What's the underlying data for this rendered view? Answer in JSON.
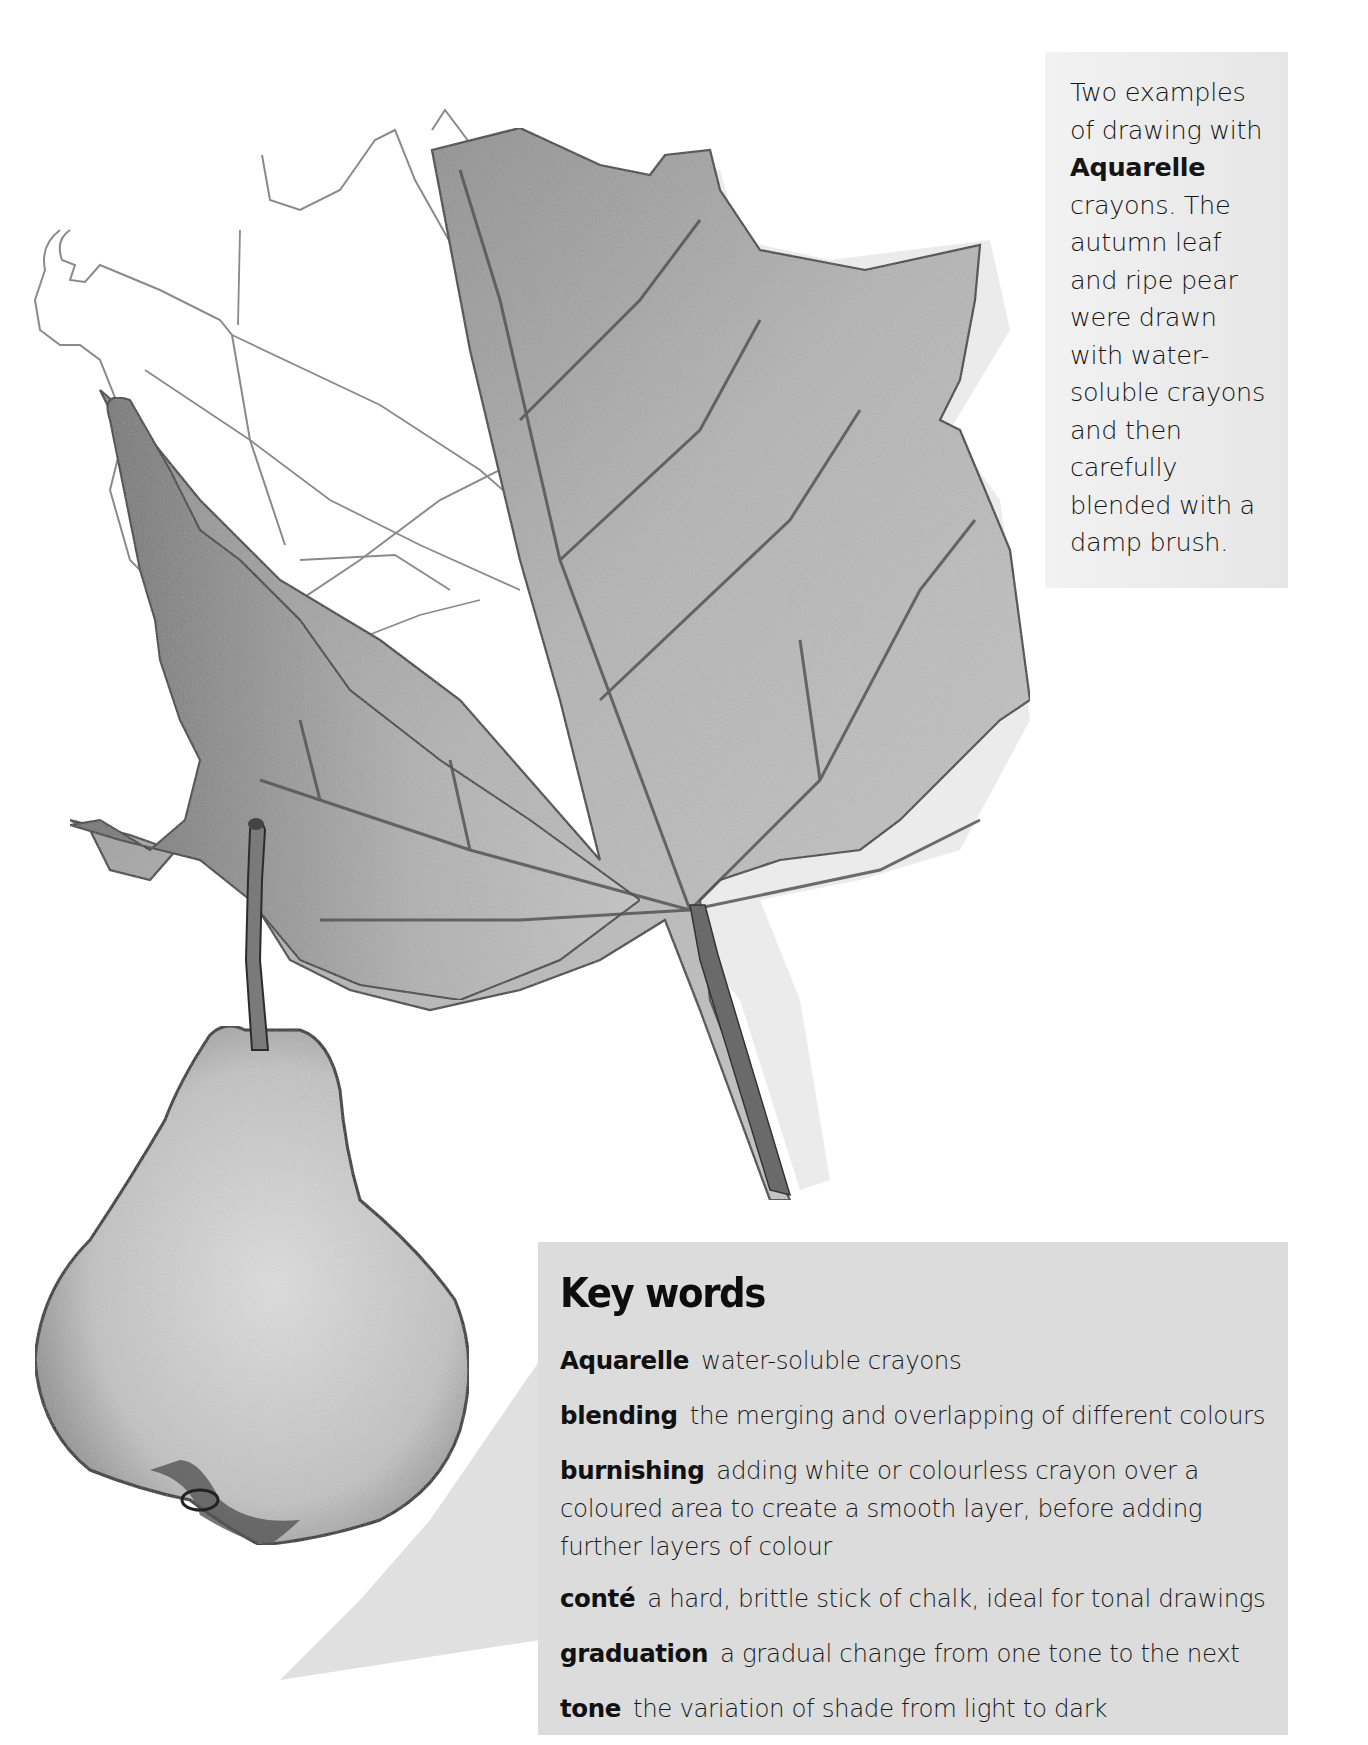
{
  "caption": {
    "lines": [
      {
        "text": "Two examples",
        "bold": false
      },
      {
        "text": "of drawing with",
        "bold": false
      },
      {
        "text": "Aquarelle",
        "bold": true
      },
      {
        "text": "crayons. The",
        "bold": false
      },
      {
        "text": "autumn leaf",
        "bold": false
      },
      {
        "text": "and ripe pear",
        "bold": false
      },
      {
        "text": "were drawn",
        "bold": false
      },
      {
        "text": "with water-",
        "bold": false
      },
      {
        "text": "soluble crayons",
        "bold": false
      },
      {
        "text": "and then",
        "bold": false
      },
      {
        "text": "carefully",
        "bold": false
      },
      {
        "text": "blended with a",
        "bold": false
      },
      {
        "text": "damp brush.",
        "bold": false
      }
    ]
  },
  "key_words": {
    "title": "Key words",
    "entries": [
      {
        "term": "Aquarelle",
        "definition": "water-soluble crayons"
      },
      {
        "term": "blending",
        "definition": "the merging and overlapping of different colours"
      },
      {
        "term": "burnishing",
        "definition": "adding white or colourless crayon over a coloured area to create a smooth layer, before adding further layers of colour"
      },
      {
        "term": "conté",
        "definition": "a hard, brittle stick of chalk, ideal for tonal drawings"
      },
      {
        "term": "graduation",
        "definition": "a gradual change from one tone to the next"
      },
      {
        "term": "tone",
        "definition": "the variation of shade from light to dark"
      }
    ]
  },
  "illustrations": [
    {
      "name": "autumn-leaf",
      "description": "Pencil and Aquarelle crayon drawing of a maple leaf, left lobes in outline only, right side shaded"
    },
    {
      "name": "ripe-pear",
      "description": "Shaded Aquarelle crayon drawing of a pear with stalk and cast shadow"
    }
  ],
  "colors": {
    "page_bg": "#ffffff",
    "caption_box_bg": "#ececec",
    "keywords_box_bg": "#dcdcdc",
    "text": "#111111"
  }
}
